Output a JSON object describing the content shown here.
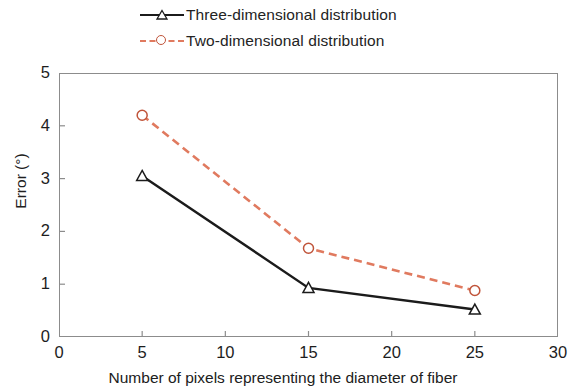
{
  "chart_data": {
    "type": "line",
    "title": "",
    "xlabel": "Number of pixels representing the diameter of fiber",
    "ylabel": "Error (°)",
    "xlim": [
      0,
      30
    ],
    "ylim": [
      0,
      5
    ],
    "xticks": [
      "0",
      "5",
      "10",
      "15",
      "20",
      "25",
      "30"
    ],
    "yticks": [
      "0",
      "1",
      "2",
      "3",
      "4",
      "5"
    ],
    "grid": false,
    "legend_position": "top",
    "x": [
      5,
      15,
      25
    ],
    "series": [
      {
        "name": "Three-dimensional distribution",
        "values": [
          3.05,
          0.93,
          0.52
        ],
        "color": "#1b1b1b",
        "linestyle": "solid",
        "marker": "triangle-open"
      },
      {
        "name": "Two-dimensional distribution",
        "values": [
          4.2,
          1.68,
          0.88
        ],
        "color": "#e07a5f",
        "linestyle": "dashed",
        "marker": "circle-open"
      }
    ]
  },
  "legend": {
    "items": [
      {
        "label": "Three-dimensional distribution"
      },
      {
        "label": "Two-dimensional distribution"
      }
    ]
  }
}
